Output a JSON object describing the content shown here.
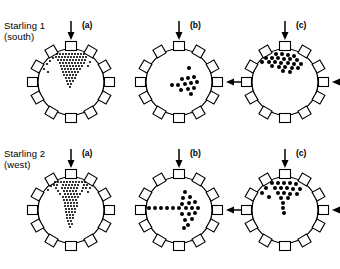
{
  "figure": {
    "type": "orientation-cage-diagram",
    "background_color": "#ffffff",
    "ink_color": "#000000",
    "perch_count": 12,
    "rows": [
      {
        "id": "row-1",
        "label_line1": "Starling 1",
        "label_line2": "(south)",
        "panels": [
          {
            "id": "r1-a",
            "label": "(a)",
            "arrows": [
              "top-down"
            ],
            "pattern": "dense-wedge-north",
            "dot_count": 128
          },
          {
            "id": "r1-b",
            "label": "(b)",
            "arrows": [
              "top-down",
              "right-left"
            ],
            "pattern": "cluster-east",
            "dot_count": 13
          },
          {
            "id": "r1-c",
            "label": "(c)",
            "arrows": [
              "top-down",
              "right-left"
            ],
            "pattern": "cluster-north-northeast",
            "dot_count": 24
          }
        ]
      },
      {
        "id": "row-2",
        "label_line1": "Starling 2",
        "label_line2": "(west)",
        "panels": [
          {
            "id": "r2-a",
            "label": "(a)",
            "arrows": [
              "top-down"
            ],
            "pattern": "dense-funnel-north",
            "dot_count": 120
          },
          {
            "id": "r2-b",
            "label": "(b)",
            "arrows": [
              "top-down",
              "right-left"
            ],
            "pattern": "arrow-east",
            "dot_count": 22
          },
          {
            "id": "r2-c",
            "label": "(c)",
            "arrows": [
              "top-down",
              "right-left"
            ],
            "pattern": "cluster-north",
            "dot_count": 23
          }
        ]
      }
    ]
  }
}
